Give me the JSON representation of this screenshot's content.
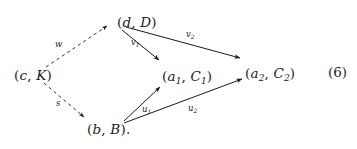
{
  "diagram": {
    "kind": "commutative-diagram",
    "equation_number": "(6)",
    "nodes": [
      {
        "id": "d-D",
        "name": "node-d-D",
        "text": "(d, D)",
        "base": "d",
        "pair": "D",
        "x": 117,
        "y": 16
      },
      {
        "id": "c-K",
        "name": "node-c-K",
        "text": "(c, K)",
        "base": "c",
        "pair": "K",
        "x": 14,
        "y": 69
      },
      {
        "id": "a1-C1",
        "name": "node-a1-C1",
        "text": "(a1, C1)",
        "base": "a",
        "base_sub": "1",
        "pair": "C",
        "pair_sub": "1",
        "x": 162,
        "y": 70
      },
      {
        "id": "a2-C2",
        "name": "node-a2-C2",
        "text": "(a2, C2)",
        "base": "a",
        "base_sub": "2",
        "pair": "C",
        "pair_sub": "2",
        "x": 245,
        "y": 67
      },
      {
        "id": "b-B",
        "name": "node-b-B",
        "text": "(b, B).",
        "base": "b",
        "pair": "B",
        "trailing": ".",
        "x": 87,
        "y": 123
      }
    ],
    "edges": [
      {
        "id": "w",
        "name": "edge-w",
        "label": "w",
        "from": "c-K",
        "to": "d-D",
        "style": "dashed",
        "x1": 46,
        "y1": 67,
        "x2": 107,
        "y2": 26,
        "label_x": 55,
        "label_y": 40
      },
      {
        "id": "s",
        "name": "edge-s",
        "label": "s",
        "from": "c-K",
        "to": "b-B",
        "style": "dashed",
        "x1": 44,
        "y1": 83,
        "x2": 84,
        "y2": 117,
        "label_x": 56,
        "label_y": 99
      },
      {
        "id": "v1",
        "name": "edge-v1",
        "label": "v1",
        "label_base": "v",
        "label_sub": "1",
        "from": "d-D",
        "to": "a1-C1",
        "style": "solid",
        "x1": 122,
        "y1": 30,
        "x2": 159,
        "y2": 60,
        "label_x": 131,
        "label_y": 38
      },
      {
        "id": "v2",
        "name": "edge-v2",
        "label": "v2",
        "label_base": "v",
        "label_sub": "2",
        "from": "d-D",
        "to": "a2-C2",
        "style": "solid",
        "x1": 126,
        "y1": 27,
        "x2": 240,
        "y2": 58,
        "label_x": 186,
        "label_y": 30
      },
      {
        "id": "u1",
        "name": "edge-u1",
        "label": "u1",
        "label_base": "u",
        "label_sub": "1",
        "from": "b-B",
        "to": "a1-C1",
        "style": "solid",
        "x1": 124,
        "y1": 121,
        "x2": 160,
        "y2": 87,
        "label_x": 142,
        "label_y": 105
      },
      {
        "id": "u2",
        "name": "edge-u2",
        "label": "u2",
        "label_base": "u",
        "label_sub": "2",
        "from": "b-B",
        "to": "a2-C2",
        "style": "solid",
        "x1": 124,
        "y1": 123,
        "x2": 242,
        "y2": 79,
        "label_x": 188,
        "label_y": 104
      }
    ]
  }
}
